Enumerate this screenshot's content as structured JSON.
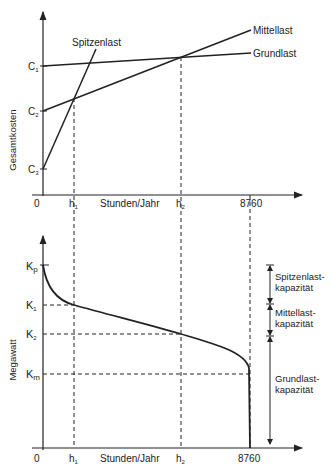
{
  "top_chart": {
    "y_label": "Gesamtkosten",
    "x_label": "Stunden/Jahr",
    "y_ticks": {
      "c1": "C",
      "c2": "C",
      "c3": "C",
      "c1_sub": "1",
      "c2_sub": "2",
      "c3_sub": "3"
    },
    "x_ticks": {
      "zero": "0",
      "h1": "h",
      "h1_sub": "1",
      "h2": "h",
      "h2_sub": "2",
      "end": "8760"
    },
    "lines": {
      "peak": "Spitzenlast",
      "middle": "Mittellast",
      "base": "Grundlast"
    }
  },
  "bottom_chart": {
    "y_label": "Megawatt",
    "x_label": "Stunden/Jahr",
    "y_ticks": {
      "kp": "K",
      "kp_sub": "p",
      "k1": "K",
      "k1_sub": "1",
      "k2": "K",
      "k2_sub": "2",
      "km": "K",
      "km_sub": "m"
    },
    "x_ticks": {
      "zero": "0",
      "h1": "h",
      "h1_sub": "1",
      "h2": "h",
      "h2_sub": "2",
      "end": "8760"
    },
    "capacity_labels": {
      "peak_1": "Spitzenlast-",
      "peak_2": "kapazität",
      "middle_1": "Mittellast-",
      "middle_2": "kapazität",
      "base_1": "Grundlast-",
      "base_2": "kapazität"
    }
  }
}
